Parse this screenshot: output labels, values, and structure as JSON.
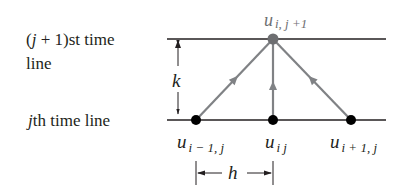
{
  "labels": {
    "top_line": {
      "prefix": "(",
      "var": "j",
      "mid": " + 1)st time",
      "line2": "line"
    },
    "bottom_line": {
      "var": "j",
      "rest": "th time line"
    },
    "k": "k",
    "h": "h"
  },
  "nodes": {
    "top": {
      "main": "u",
      "sub": "i, j +1"
    },
    "left": {
      "main": "u",
      "sub": "i − 1, j"
    },
    "center": {
      "main": "u",
      "sub": "i j"
    },
    "right": {
      "main": "u",
      "sub": "i + 1, j"
    }
  },
  "colors": {
    "line": "#231f20",
    "stencil": "#808285",
    "node_top": "#6d6e71",
    "node_bottom": "#000000"
  }
}
